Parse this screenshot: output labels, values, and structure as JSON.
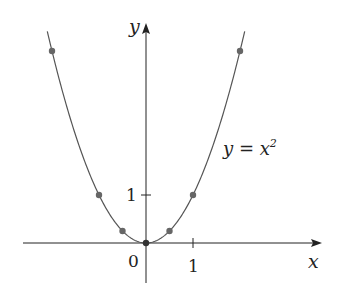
{
  "chart_data": {
    "type": "line",
    "title": "",
    "xlabel": "x",
    "ylabel": "y",
    "function_label": "y = x",
    "function_label_exp": "2",
    "origin_label": "0",
    "x_tick_labels": [
      "1"
    ],
    "y_tick_labels": [
      "1"
    ],
    "series": [
      {
        "name": "y = x^2",
        "x": [
          -2.1,
          -1.5,
          -1,
          -0.5,
          0,
          0.5,
          1,
          1.5,
          2.1
        ],
        "y": [
          4.41,
          2.25,
          1,
          0.25,
          0,
          0.25,
          1,
          2.25,
          4.41
        ]
      }
    ],
    "marked_points": [
      {
        "x": -2,
        "y": 4
      },
      {
        "x": -1,
        "y": 1
      },
      {
        "x": -0.5,
        "y": 0.25
      },
      {
        "x": 0,
        "y": 0
      },
      {
        "x": 0.5,
        "y": 0.25
      },
      {
        "x": 1,
        "y": 1
      },
      {
        "x": 2,
        "y": 4
      }
    ],
    "xlim": [
      -2.6,
      3.9
    ],
    "ylim": [
      -0.9,
      4.5
    ],
    "grid": false,
    "colors": {
      "curve": "#555555",
      "points": "#666666",
      "axes": "#222222"
    }
  }
}
